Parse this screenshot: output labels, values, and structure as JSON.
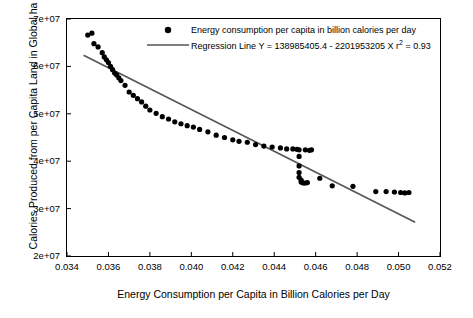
{
  "chart_data": {
    "type": "scatter",
    "title": "",
    "xlabel": "Energy Consumption per Capita in Billion Calories per Day",
    "ylabel": "Calories Produced from per Capita Land in Global ha",
    "xlim": [
      0.034,
      0.052
    ],
    "ylim": [
      20000000,
      70000000
    ],
    "xticks": [
      "0.034",
      "0.036",
      "0.038",
      "0.040",
      "0.042",
      "0.044",
      "0.046",
      "0.048",
      "0.050",
      "0.052"
    ],
    "yticks": [
      "2e+07",
      "3e+07",
      "4e+07",
      "5e+07",
      "6e+07",
      "7e+07"
    ],
    "grid": false,
    "legend_position": "top-center",
    "series": [
      {
        "name": "Energy consumption per capita in billion calories per day",
        "type": "scatter",
        "marker": "filled-circle",
        "color": "#000000",
        "points": [
          [
            0.035,
            66600000
          ],
          [
            0.0352,
            67000000
          ],
          [
            0.0353,
            64800000
          ],
          [
            0.0355,
            64100000
          ],
          [
            0.0357,
            62900000
          ],
          [
            0.0358,
            62000000
          ],
          [
            0.0359,
            61400000
          ],
          [
            0.036,
            60800000
          ],
          [
            0.0361,
            60000000
          ],
          [
            0.0362,
            59300000
          ],
          [
            0.0363,
            58600000
          ],
          [
            0.0364,
            58200000
          ],
          [
            0.0365,
            57600000
          ],
          [
            0.0366,
            57000000
          ],
          [
            0.0368,
            56000000
          ],
          [
            0.037,
            54600000
          ],
          [
            0.0372,
            53900000
          ],
          [
            0.0374,
            53200000
          ],
          [
            0.0376,
            52500000
          ],
          [
            0.0378,
            51600000
          ],
          [
            0.038,
            50800000
          ],
          [
            0.0383,
            50100000
          ],
          [
            0.0386,
            49400000
          ],
          [
            0.0389,
            48900000
          ],
          [
            0.0392,
            48300000
          ],
          [
            0.0395,
            47900000
          ],
          [
            0.0398,
            47500000
          ],
          [
            0.0401,
            47200000
          ],
          [
            0.0404,
            46700000
          ],
          [
            0.0408,
            46200000
          ],
          [
            0.0412,
            45500000
          ],
          [
            0.0416,
            45000000
          ],
          [
            0.042,
            44500000
          ],
          [
            0.0423,
            44200000
          ],
          [
            0.0427,
            44000000
          ],
          [
            0.0431,
            43500000
          ],
          [
            0.0435,
            43200000
          ],
          [
            0.0439,
            43000000
          ],
          [
            0.0443,
            42800000
          ],
          [
            0.0446,
            42600000
          ],
          [
            0.0449,
            42600000
          ],
          [
            0.0451,
            42500000
          ],
          [
            0.0452,
            42400000
          ],
          [
            0.0452,
            41000000
          ],
          [
            0.0452,
            39000000
          ],
          [
            0.0452,
            37600000
          ],
          [
            0.0452,
            36600000
          ],
          [
            0.0453,
            36000000
          ],
          [
            0.0453,
            35600000
          ],
          [
            0.0454,
            35400000
          ],
          [
            0.0455,
            35400000
          ],
          [
            0.0456,
            35500000
          ],
          [
            0.0455,
            42400000
          ],
          [
            0.0457,
            42300000
          ],
          [
            0.0458,
            42400000
          ],
          [
            0.0462,
            36400000
          ],
          [
            0.0468,
            34800000
          ],
          [
            0.0478,
            34700000
          ],
          [
            0.0489,
            33600000
          ],
          [
            0.0494,
            33600000
          ],
          [
            0.0498,
            33500000
          ],
          [
            0.0501,
            33400000
          ],
          [
            0.0503,
            33300000
          ],
          [
            0.0505,
            33400000
          ]
        ]
      },
      {
        "name": "Regression Line",
        "type": "line",
        "color": "#555555",
        "equation": "Y = 138985405.4 - 2201953205 X",
        "r2": 0.93,
        "intercept": 138985405.4,
        "slope": -2201953205,
        "x_start": 0.0348,
        "x_end": 0.0508
      }
    ]
  },
  "legend": {
    "entries": [
      {
        "label": "Energy consumption per capita in billion calories per day",
        "marker": "filled-circle"
      },
      {
        "label_pre": "Regression Line Y = 138985405.4 - 2201953205 X r",
        "label_sup": "2",
        "label_post": " = 0.93",
        "marker": "line"
      }
    ]
  }
}
